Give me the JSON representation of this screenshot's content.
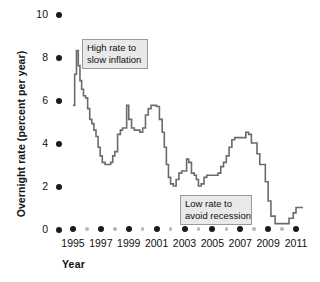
{
  "chart_data": {
    "type": "line",
    "title": "",
    "xlabel": "Year",
    "ylabel": "Overnight rate (percent per year)",
    "xlim": [
      1995,
      2011.6
    ],
    "ylim": [
      0,
      10
    ],
    "grid": false,
    "legend": "none",
    "line_color": "#6b6b6b",
    "y_ticks": [
      0,
      2,
      4,
      6,
      8,
      10
    ],
    "y_tick_labels": [
      "0",
      "2",
      "4",
      "6",
      "8",
      "10"
    ],
    "x_ticks": [
      1995,
      1997,
      1999,
      2001,
      2003,
      2005,
      2007,
      2009,
      2011
    ],
    "x_tick_labels": [
      "1995",
      "1997",
      "1999",
      "2001",
      "2003",
      "2005",
      "2007",
      "2009",
      "2011"
    ],
    "x_minor_ticks": [
      1996,
      1998,
      2000,
      2002,
      2004,
      2006,
      2008,
      2010
    ],
    "series": [
      {
        "name": "Overnight rate",
        "x": [
          1995.0,
          1995.12,
          1995.25,
          1995.38,
          1995.5,
          1995.62,
          1995.75,
          1995.9,
          1996.05,
          1996.2,
          1996.35,
          1996.5,
          1996.65,
          1996.8,
          1996.95,
          1997.1,
          1997.3,
          1997.5,
          1997.7,
          1997.85,
          1998.0,
          1998.2,
          1998.4,
          1998.55,
          1998.7,
          1998.85,
          1999.0,
          1999.2,
          1999.4,
          1999.6,
          1999.8,
          2000.0,
          2000.2,
          2000.4,
          2000.6,
          2000.8,
          2001.0,
          2001.2,
          2001.4,
          2001.55,
          2001.7,
          2001.85,
          2002.0,
          2002.2,
          2002.4,
          2002.6,
          2002.8,
          2003.0,
          2003.15,
          2003.3,
          2003.5,
          2003.7,
          2003.85,
          2004.0,
          2004.2,
          2004.4,
          2004.6,
          2004.8,
          2005.0,
          2005.2,
          2005.4,
          2005.6,
          2005.8,
          2006.0,
          2006.2,
          2006.4,
          2006.6,
          2006.8,
          2007.0,
          2007.2,
          2007.4,
          2007.6,
          2007.8,
          2008.0,
          2008.2,
          2008.4,
          2008.6,
          2008.8,
          2009.0,
          2009.2,
          2009.5,
          2009.9,
          2010.2,
          2010.5,
          2010.8,
          2011.0,
          2011.5
        ],
        "y": [
          5.75,
          7.2,
          8.3,
          7.6,
          6.9,
          6.5,
          6.2,
          6.1,
          5.6,
          5.1,
          4.9,
          4.6,
          4.3,
          3.8,
          3.4,
          3.1,
          3.0,
          3.0,
          3.1,
          3.4,
          3.6,
          4.4,
          4.6,
          4.7,
          4.7,
          5.75,
          5.1,
          4.7,
          4.6,
          4.6,
          4.5,
          4.7,
          5.3,
          5.6,
          5.75,
          5.75,
          5.7,
          5.1,
          4.5,
          3.8,
          3.0,
          2.4,
          2.1,
          2.0,
          2.3,
          2.6,
          2.7,
          2.7,
          3.25,
          3.1,
          2.6,
          2.5,
          2.3,
          2.0,
          2.1,
          2.4,
          2.5,
          2.5,
          2.5,
          2.5,
          2.6,
          2.9,
          3.1,
          3.4,
          3.8,
          4.15,
          4.25,
          4.25,
          4.25,
          4.25,
          4.5,
          4.4,
          4.0,
          4.0,
          3.5,
          3.0,
          3.0,
          2.2,
          1.3,
          0.6,
          0.25,
          0.25,
          0.25,
          0.5,
          0.75,
          1.0,
          1.0
        ]
      }
    ],
    "annotations": [
      {
        "name": "high-rate-annotation",
        "line1": "High rate to",
        "line2": "slow inflation",
        "x_px": 82,
        "y_px": 39,
        "width_px": 66,
        "height_px": 30
      },
      {
        "name": "low-rate-annotation",
        "line1": "Low rate to",
        "line2": "avoid recession",
        "x_px": 180,
        "y_px": 195,
        "width_px": 72,
        "height_px": 30
      }
    ]
  }
}
